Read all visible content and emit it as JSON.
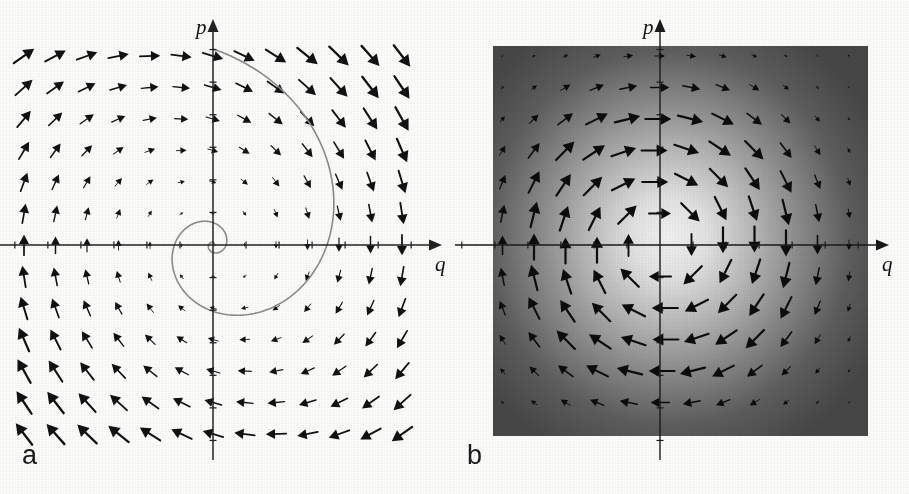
{
  "figure": {
    "background_color": "#fdfdfc",
    "panels": [
      {
        "id": "a",
        "label": "a",
        "caption": "",
        "axis_x_label": "q",
        "axis_y_label": "p",
        "axis_color": "#222222",
        "arrow_color": "#111111",
        "trajectory_color": "#8c8c8c",
        "background_color": "#ffffff",
        "origin": {
          "x": 213,
          "y": 245
        },
        "grid_spacing": 31.5,
        "grid_cols": 13,
        "grid_rows": 13,
        "tick_count_x": 12,
        "tick_count_y": 12,
        "has_trajectory": true,
        "trajectory_type": "logarithmic-spiral",
        "trajectory_turns": 2.35,
        "trajectory_r0": 196,
        "trajectory_decay": 0.345
      },
      {
        "id": "b",
        "label": "b",
        "caption": "",
        "axis_x_label": "q",
        "axis_y_label": "p",
        "axis_color": "#1a1a1a",
        "arrow_color": "#0c0c0c",
        "background_color": "#4a4a4a",
        "gradient_center_color": "#f2f2f2",
        "gradient_edge_color": "#474747",
        "origin": {
          "x": 205,
          "y": 245
        },
        "square": {
          "x": 38,
          "y": 46,
          "width": 375,
          "height": 390
        },
        "grid_spacing": 31.5,
        "grid_cols": 13,
        "grid_rows": 13,
        "tick_count_x": 12,
        "tick_count_y": 12,
        "has_trajectory": false
      }
    ]
  },
  "chart_data": {
    "type": "scatter",
    "xlabel": "q",
    "ylabel": "p",
    "xlim": [
      -6.5,
      6.5
    ],
    "ylim": [
      -6.5,
      6.5
    ],
    "grid": false,
    "legend": null,
    "annotations": [
      "a",
      "b"
    ],
    "series": [
      {
        "name": "panel-a-vector-field",
        "kind": "quiver",
        "description": "Clockwise spiral-sink vector field on a 13x13 grid; arrow length grows with radius",
        "field": "dq/dt = p,  dp/dt = -q - 0.30 p",
        "rotation": "clockwise",
        "grid_x": [
          -6,
          -5,
          -4,
          -3,
          -2,
          -1,
          0,
          1,
          2,
          3,
          4,
          5,
          6
        ],
        "grid_y": [
          6,
          5,
          4,
          3,
          2,
          1,
          0,
          -1,
          -2,
          -3,
          -4,
          -5,
          -6
        ]
      },
      {
        "name": "panel-a-trajectory",
        "kind": "line",
        "description": "Gray inward logarithmic spiral starting at top of p-axis, converging to the origin",
        "turns": 2.35,
        "r_start": 196,
        "decay_per_radian": 0.345
      },
      {
        "name": "panel-b-vector-field",
        "kind": "quiver",
        "description": "Clockwise circulating vector field over a radial grayscale density map; arrows largest at mid radius",
        "field": "dq/dt = p,  dp/dt = -q",
        "rotation": "clockwise",
        "grid_x": [
          -6,
          -5,
          -4,
          -3,
          -2,
          -1,
          0,
          1,
          2,
          3,
          4,
          5,
          6
        ],
        "grid_y": [
          6,
          5,
          4,
          3,
          2,
          1,
          0,
          -1,
          -2,
          -3,
          -4,
          -5,
          -6
        ]
      },
      {
        "name": "panel-b-density",
        "kind": "heatmap",
        "description": "Gaussian phase-space density, bright at origin fading to dark gray at edges",
        "peak_value": 1.0,
        "edge_value": 0.22,
        "colormap": "gray"
      }
    ]
  }
}
